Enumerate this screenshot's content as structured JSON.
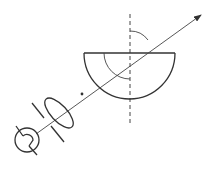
{
  "diagram": {
    "colors": {
      "line": "#333333",
      "background": "#ffffff"
    },
    "components": [
      {
        "name": "lamp",
        "type": "light-source"
      },
      {
        "name": "slit",
        "type": "aperture"
      },
      {
        "name": "convex-lens",
        "type": "lens"
      },
      {
        "name": "semicircular-block",
        "type": "glass-block"
      },
      {
        "name": "normal-line",
        "type": "dashed-line"
      },
      {
        "name": "light-ray",
        "type": "arrow"
      },
      {
        "name": "angle-of-incidence-arc",
        "type": "angle-arc"
      },
      {
        "name": "angle-of-refraction-arc",
        "type": "angle-arc"
      }
    ]
  }
}
